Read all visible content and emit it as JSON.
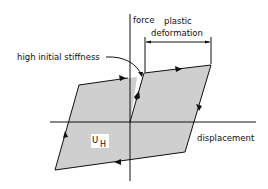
{
  "diagram": {
    "type": "hysteresis-loop",
    "axes": {
      "vertical_label": "force",
      "horizontal_label": "displacement"
    },
    "annotations": {
      "plastic_line1": "plastic",
      "plastic_line2": "deformation",
      "stiffness": "high initial stiffness",
      "area_main": "U",
      "area_sub": "H"
    },
    "colors": {
      "fill": "#cfcfcf",
      "stroke": "#111111",
      "background": "#ffffff"
    }
  }
}
